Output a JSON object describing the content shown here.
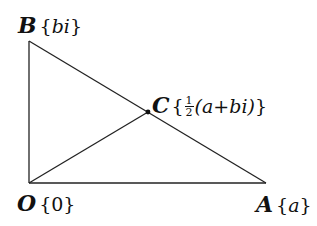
{
  "diagram": {
    "type": "geometry-triangle",
    "stroke_color": "#222222",
    "points": [
      {
        "id": "O",
        "label": "O",
        "value": "0",
        "x": 29,
        "y": 183
      },
      {
        "id": "A",
        "label": "A",
        "value": "a",
        "x": 266,
        "y": 183
      },
      {
        "id": "B",
        "label": "B",
        "value": "bi",
        "x": 29,
        "y": 41
      },
      {
        "id": "C",
        "label": "C",
        "value_frac_num": "1",
        "value_frac_den": "2",
        "value_rest": "(a+bi)",
        "x": 148,
        "y": 112
      }
    ],
    "segments": [
      {
        "from": "O",
        "to": "A"
      },
      {
        "from": "O",
        "to": "B"
      },
      {
        "from": "B",
        "to": "A"
      },
      {
        "from": "O",
        "to": "C"
      }
    ],
    "labels": {
      "B": {
        "name": "B",
        "open": "{",
        "val": "bi",
        "close": "}"
      },
      "C": {
        "name": "C",
        "open": "{",
        "num": "1",
        "den": "2",
        "val": "(a+bi)",
        "close": "}"
      },
      "O": {
        "name": "O",
        "open": "{",
        "val": "0",
        "close": "}"
      },
      "A": {
        "name": "A",
        "open": "{",
        "val": "a",
        "close": "}"
      }
    }
  }
}
